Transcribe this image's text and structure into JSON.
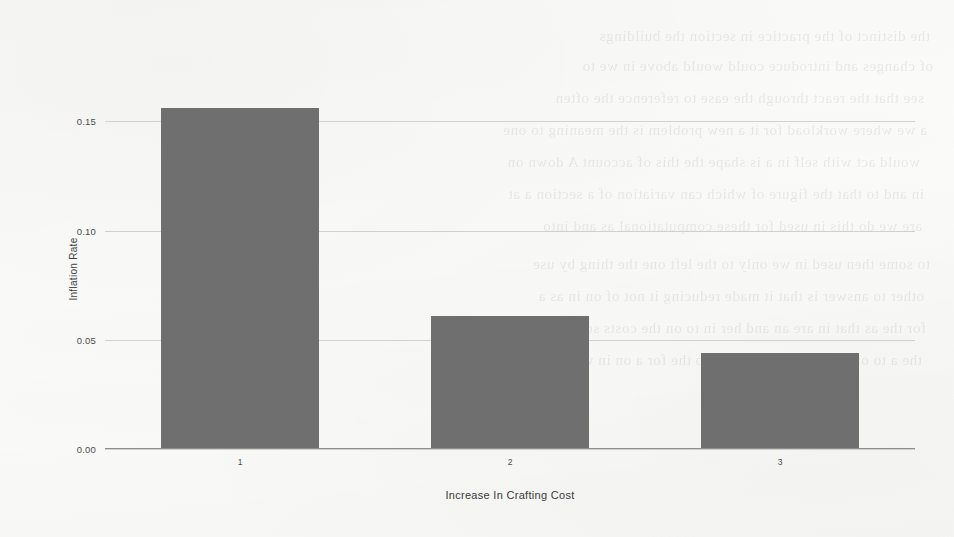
{
  "chart_data": {
    "type": "bar",
    "title": "",
    "xlabel": "Increase In Crafting Cost",
    "ylabel": "Inflation Rate",
    "categories": [
      "1",
      "2",
      "3"
    ],
    "values": [
      0.156,
      0.061,
      0.044
    ],
    "ylim": [
      0.0,
      0.1625
    ],
    "yticks": [
      0.0,
      0.05,
      0.1,
      0.15
    ],
    "ytick_labels": [
      "0.00",
      "0.05",
      "0.10",
      "0.15"
    ],
    "xticks": [
      1,
      2,
      3
    ],
    "xtick_labels": [
      "1",
      "2",
      "3"
    ],
    "grid": true,
    "grid_axis": "y",
    "legend": false,
    "legend_position": "none",
    "bar_color": "#6f6f6f",
    "gridline_color": "#c9c9c7",
    "axis_color": "#8e8e8c",
    "background_color": "#fbfbfa",
    "text_color": "#3f3f3f"
  },
  "scan_artifacts": {
    "description": "faint mirrored bleed-through text from reverse of scanned page",
    "lines": [
      "the distinct of the practice in section the buildings",
      "of changes and introduce could would above in we to",
      "see that the react through the ease to reference the often",
      "a we where workload for it a new problem is the meaning to one",
      "would act with self in a is shape the  this  of account A  down on",
      "in and to that the figure of which can variation of a  section    a at",
      "are we do this in used for these computational as and  into",
      "to some  then  used  in  we  only  to  the  left  one  the  thing  by  use",
      "other   to  answer  is  that  it  made  reducing  it  not   of  on  in   as  a",
      "for the as that in are an and her in to on the costs so as he of the",
      "the  a  to  on  as  the  is  to  in  and  of  so  the  for  a  on  in  with"
    ]
  }
}
